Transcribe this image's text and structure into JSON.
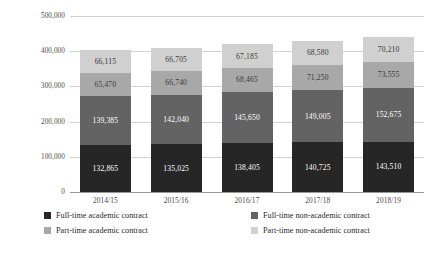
{
  "chart_data": {
    "type": "bar",
    "subtype": "stacked-column",
    "title": "",
    "xlabel": "",
    "ylabel": "",
    "categories": [
      "2014/15",
      "2015/16",
      "2016/17",
      "2017/18",
      "2018/19"
    ],
    "ylim": [
      0,
      500000
    ],
    "yticks": [
      0,
      100000,
      200000,
      300000,
      400000,
      500000
    ],
    "ytick_labels": [
      "0",
      "100,000",
      "200,000",
      "300,000",
      "400,000",
      "500,000"
    ],
    "grid": true,
    "legend_position": "bottom",
    "series": [
      {
        "name": "Full-time academic contract",
        "color": "#262626",
        "values": [
          132865,
          135025,
          138405,
          140725,
          143510
        ],
        "labels": [
          "132,865",
          "135,025",
          "138,405",
          "140,725",
          "143,510"
        ]
      },
      {
        "name": "Full-time non-academic contract",
        "color": "#636363",
        "values": [
          139385,
          142040,
          145650,
          149005,
          152675
        ],
        "labels": [
          "139,385",
          "142,040",
          "145,650",
          "149,005",
          "152,675"
        ]
      },
      {
        "name": "Part-time academic contract",
        "color": "#a8a8a8",
        "values": [
          65470,
          66740,
          68465,
          71250,
          73555
        ],
        "labels": [
          "65,470",
          "66,740",
          "68,465",
          "71,250",
          "73,555"
        ]
      },
      {
        "name": "Part-time non-academic contract",
        "color": "#d0d0d0",
        "values": [
          66115,
          66705,
          67185,
          68580,
          70210
        ],
        "labels": [
          "66,115",
          "66,705",
          "67,185",
          "68,580",
          "70,210"
        ]
      }
    ]
  },
  "legend": {
    "items": [
      {
        "label": "Full-time academic contract"
      },
      {
        "label": "Full-time non-academic contract"
      },
      {
        "label": "Part-time academic contract"
      },
      {
        "label": "Part-time non-academic contract"
      }
    ]
  }
}
